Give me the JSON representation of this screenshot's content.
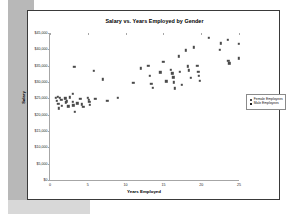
{
  "chart_data": {
    "type": "scatter",
    "title": "Salary vs. Years Employed by Gender",
    "xlabel": "Years Employed",
    "ylabel": "Salary",
    "xlim": [
      0,
      25
    ],
    "ylim": [
      0,
      45000
    ],
    "grid": false,
    "legend_position": "right",
    "xticks": [
      "0",
      "5",
      "10",
      "15",
      "20",
      "25"
    ],
    "xtick_values": [
      0,
      5,
      10,
      15,
      20,
      25
    ],
    "yticks": [
      "$0",
      "$5,000",
      "$10,000",
      "$15,000",
      "$20,000",
      "$25,000",
      "$30,000",
      "$35,000",
      "$40,000",
      "$45,000"
    ],
    "ytick_values": [
      0,
      5000,
      10000,
      15000,
      20000,
      25000,
      30000,
      35000,
      40000,
      45000
    ],
    "series": [
      {
        "name": "Female Employees",
        "color": "#4a4a4a",
        "marker": "square",
        "points": [
          [
            0.8,
            25200
          ],
          [
            0.9,
            24300
          ],
          [
            1.0,
            25500
          ],
          [
            1.1,
            23400
          ],
          [
            1.2,
            21900
          ],
          [
            1.3,
            25100
          ],
          [
            1.5,
            24600
          ],
          [
            1.6,
            22700
          ],
          [
            2.0,
            25000
          ],
          [
            2.1,
            23800
          ],
          [
            2.2,
            24100
          ],
          [
            2.4,
            22600
          ],
          [
            2.6,
            25300
          ],
          [
            3.0,
            26400
          ],
          [
            3.0,
            24000
          ],
          [
            3.1,
            22900
          ],
          [
            3.2,
            34700
          ],
          [
            3.3,
            20800
          ],
          [
            3.6,
            23500
          ],
          [
            4.0,
            24800
          ],
          [
            4.2,
            23200
          ],
          [
            4.4,
            22400
          ],
          [
            5.0,
            25200
          ],
          [
            5.1,
            24500
          ],
          [
            5.2,
            23900
          ],
          [
            5.3,
            23100
          ],
          [
            5.8,
            33400
          ],
          [
            6.0,
            24900
          ],
          [
            7.0,
            30800
          ],
          [
            7.6,
            24300
          ],
          [
            9.0,
            25100
          ],
          [
            11.0,
            29700
          ],
          [
            12.0,
            34200
          ],
          [
            13.0,
            35000
          ],
          [
            13.2,
            31900
          ],
          [
            13.4,
            29500
          ],
          [
            13.6,
            28300
          ],
          [
            14.6,
            33000
          ],
          [
            15.0,
            36100
          ],
          [
            15.4,
            30200
          ],
          [
            16.0,
            33800
          ],
          [
            16.2,
            32700
          ],
          [
            16.3,
            31400
          ],
          [
            16.4,
            29900
          ],
          [
            16.5,
            28100
          ],
          [
            17.0,
            37900
          ],
          [
            17.2,
            33100
          ],
          [
            17.4,
            29200
          ],
          [
            18.0,
            39700
          ],
          [
            18.2,
            34800
          ],
          [
            18.4,
            33600
          ],
          [
            18.6,
            31300
          ],
          [
            19.0,
            40600
          ],
          [
            19.5,
            34900
          ],
          [
            19.6,
            33100
          ],
          [
            19.7,
            31900
          ],
          [
            19.8,
            30400
          ],
          [
            21.0,
            43500
          ],
          [
            22.5,
            39800
          ],
          [
            22.6,
            41800
          ],
          [
            23.5,
            42900
          ],
          [
            23.6,
            36400
          ],
          [
            23.7,
            35700
          ],
          [
            25.0,
            41600
          ],
          [
            25.0,
            37200
          ]
        ]
      },
      {
        "name": "Male Employees",
        "color": "#1f1f1f",
        "marker": "square",
        "points": []
      }
    ]
  },
  "legend": {
    "items": [
      {
        "label": "Female Employees",
        "cls": "female"
      },
      {
        "label": "Male Employees",
        "cls": "male"
      }
    ]
  }
}
